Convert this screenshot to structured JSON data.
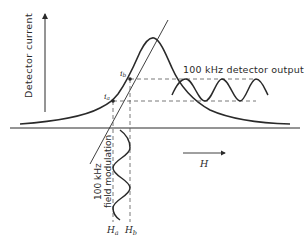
{
  "diagram": {
    "type": "Lorentzian resonance with 100 kHz field modulation",
    "axes": {
      "y_label": "Detector current",
      "x_label": "H"
    },
    "points": [
      {
        "label": "i",
        "sub": "a",
        "field_label": "H",
        "field_sub": "a"
      },
      {
        "label": "i",
        "sub": "b",
        "field_label": "H",
        "field_sub": "b"
      }
    ],
    "annotations": {
      "detector_output": "100 kHz detector output",
      "field_modulation_line1": "100 kHz",
      "field_modulation_line2": "field modulation"
    },
    "colors": {
      "ink": "#2a2a2a",
      "dashed": "#555555",
      "background": "#ffffff"
    }
  }
}
